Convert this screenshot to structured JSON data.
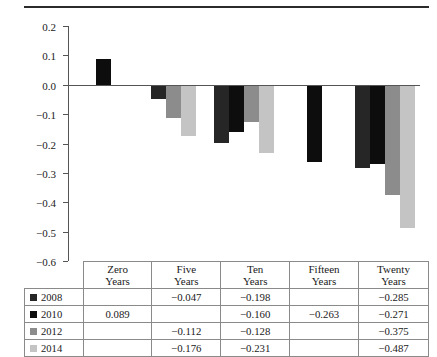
{
  "chart_data": {
    "type": "bar",
    "title": "",
    "xlabel": "",
    "ylabel": "Mean Support for Deportations",
    "ylim": [
      -0.6,
      0.2
    ],
    "ytick_labels": [
      "0.2",
      "0.1",
      "0.0",
      "−0.1",
      "−0.2",
      "−0.3",
      "−0.4",
      "−0.5",
      "−0.6"
    ],
    "ytick_values": [
      0.2,
      0.1,
      0.0,
      -0.1,
      -0.2,
      -0.3,
      -0.4,
      -0.5,
      -0.6
    ],
    "grid": false,
    "legend_position": "table-row-labels",
    "categories": [
      "Zero Years",
      "Five Years",
      "Ten Years",
      "Fifteen Years",
      "Twenty Years"
    ],
    "series": [
      {
        "name": "2008",
        "color": "#262626",
        "values": [
          null,
          -0.047,
          -0.198,
          null,
          -0.285
        ]
      },
      {
        "name": "2010",
        "color": "#0d0d0d",
        "values": [
          0.089,
          null,
          -0.16,
          -0.263,
          -0.271
        ]
      },
      {
        "name": "2012",
        "color": "#8c8c8c",
        "values": [
          null,
          -0.112,
          -0.128,
          null,
          -0.375
        ]
      },
      {
        "name": "2014",
        "color": "#c4c4c4",
        "values": [
          null,
          -0.176,
          -0.231,
          null,
          -0.487
        ]
      }
    ]
  },
  "table": {
    "column_headers": [
      {
        "line1": "Zero",
        "line2": "Years"
      },
      {
        "line1": "Five",
        "line2": "Years"
      },
      {
        "line1": "Ten",
        "line2": "Years"
      },
      {
        "line1": "Fifteen",
        "line2": "Years"
      },
      {
        "line1": "Twenty",
        "line2": "Years"
      }
    ],
    "rows": [
      {
        "label": "2008",
        "color": "#262626",
        "cells": [
          "",
          "−0.047",
          "−0.198",
          "",
          "−0.285"
        ]
      },
      {
        "label": "2010",
        "color": "#0d0d0d",
        "cells": [
          "0.089",
          "",
          "−0.160",
          "−0.263",
          "−0.271"
        ]
      },
      {
        "label": "2012",
        "color": "#8c8c8c",
        "cells": [
          "",
          "−0.112",
          "−0.128",
          "",
          "−0.375"
        ]
      },
      {
        "label": "2014",
        "color": "#c4c4c4",
        "cells": [
          "",
          "−0.176",
          "−0.231",
          "",
          "−0.487"
        ]
      }
    ]
  }
}
